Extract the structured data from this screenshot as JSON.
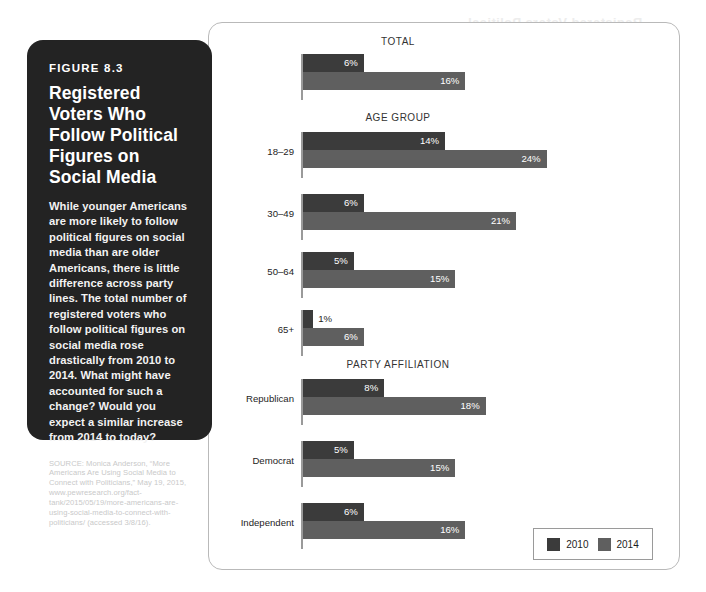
{
  "figure": {
    "number_label": "FIGURE 8.3",
    "title": "Registered Voters Who Follow Political Figures on Social Media",
    "body": "While younger Americans are more likely to follow political figures on social media than are older Americans, there is little difference across party lines. The total number of registered voters who follow political figures on social media rose drastically from 2010 to 2014. What might have accounted for such a change? Would you expect a similar increase from 2014 to today?",
    "source": "SOURCE: Monica Anderson, “More Americans Are Using Social Media to Connect with Politicians,” May 19, 2015, www.pewresearch.org/fact-tank/2015/05/19/more-americans-are-using-social-media-to-connect-with-politicians/ (accessed 3/8/16)."
  },
  "legend": {
    "items": [
      {
        "label": "2010",
        "color": "#3b3b3b"
      },
      {
        "label": "2014",
        "color": "#5f5f5f"
      }
    ]
  },
  "chart_data": {
    "type": "bar",
    "title": "Registered Voters Who Follow Political Figures on Social Media",
    "xlabel": "",
    "ylabel": "",
    "xlim": [
      0,
      26
    ],
    "unit": "%",
    "grid": false,
    "legend_position": "bottom-right",
    "series": [
      {
        "name": "2010",
        "color": "#3b3b3b"
      },
      {
        "name": "2014",
        "color": "#5f5f5f"
      }
    ],
    "groups": [
      {
        "name": "TOTAL",
        "categories": [
          ""
        ],
        "rows": [
          {
            "category": "",
            "values": [
              6,
              16
            ],
            "labels": [
              "6%",
              "16%"
            ]
          }
        ]
      },
      {
        "name": "AGE GROUP",
        "categories": [
          "18–29",
          "30–49",
          "50–64",
          "65+"
        ],
        "rows": [
          {
            "category": "18–29",
            "values": [
              14,
              24
            ],
            "labels": [
              "14%",
              "24%"
            ]
          },
          {
            "category": "30–49",
            "values": [
              6,
              21
            ],
            "labels": [
              "6%",
              "21%"
            ]
          },
          {
            "category": "50–64",
            "values": [
              5,
              15
            ],
            "labels": [
              "5%",
              "15%"
            ]
          },
          {
            "category": "65+",
            "values": [
              1,
              6
            ],
            "labels": [
              "1%",
              "6%"
            ]
          }
        ]
      },
      {
        "name": "PARTY AFFILIATION",
        "categories": [
          "Republican",
          "Democrat",
          "Independent"
        ],
        "rows": [
          {
            "category": "Republican",
            "values": [
              8,
              18
            ],
            "labels": [
              "8%",
              "18%"
            ]
          },
          {
            "category": "Democrat",
            "values": [
              5,
              15
            ],
            "labels": [
              "5%",
              "15%"
            ]
          },
          {
            "category": "Independent",
            "values": [
              6,
              16
            ],
            "labels": [
              "6%",
              "16%"
            ]
          }
        ]
      }
    ]
  },
  "bleed_text": "Registered Voters Political"
}
